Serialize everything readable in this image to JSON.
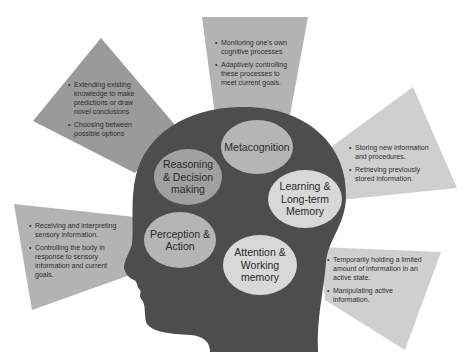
{
  "colors": {
    "head": "#4d4d4d",
    "panel_dark": "#9a9a9a",
    "panel_mid": "#b3b3b3",
    "panel_light": "#cfcfcf",
    "bubble_dark": "#a0a0a0",
    "bubble_mid": "#b5b5b5",
    "bubble_light": "#d8d8d8",
    "background": "#ffffff"
  },
  "bubbles": {
    "metacognition": {
      "label": "Metacognition"
    },
    "reasoning": {
      "label": "Reasoning & Decision making"
    },
    "learning": {
      "label": "Learning & Long-term Memory"
    },
    "perception": {
      "label": "Perception & Action"
    },
    "attention": {
      "label": "Attention & Working memory"
    }
  },
  "panels": {
    "metacognition": {
      "items": [
        "Monitoring one's own cognitive processes",
        "Adaptively controlling these processes to meet current goals."
      ]
    },
    "reasoning": {
      "items": [
        "Extending existing knowledge to make predictions or draw novel conclusions",
        "Choosing between possible options"
      ]
    },
    "learning": {
      "items": [
        "Storing new information and procedures.",
        "Retrieving previously stored information."
      ]
    },
    "perception": {
      "items": [
        "Receiving and interpreting sensory information.",
        "Controlling the body in response to sensory information and current goals."
      ]
    },
    "attention": {
      "items": [
        "Temporarily holding a limited amount of information in an active state.",
        "Manipulating active information."
      ]
    }
  }
}
